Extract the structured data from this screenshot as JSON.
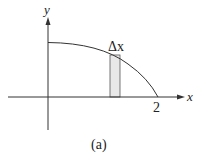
{
  "diagram": {
    "type": "function-plot",
    "axes": {
      "x_label": "x",
      "y_label": "y"
    },
    "tick_labels": {
      "x_end": "2"
    },
    "strip_label": "Δx",
    "caption": "(a)",
    "colors": {
      "axis": "#333333",
      "curve": "#333333",
      "strip_fill": "#e8e8e8",
      "strip_stroke": "#555555"
    }
  }
}
